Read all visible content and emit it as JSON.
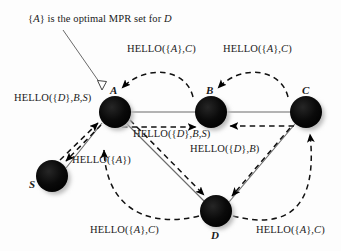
{
  "figure": {
    "type": "network-diagram",
    "caption": "{A} is the optimal MPR set for D",
    "caption_plain": "{A} is the optimal MPR set for D",
    "background_color": "#fdfdfd",
    "node_color": "#000000",
    "edge_color": "#555555",
    "arrow_color": "#000000"
  },
  "nodes": [
    {
      "id": "A",
      "label": "A",
      "cx": 115,
      "cy": 112,
      "r": 16
    },
    {
      "id": "B",
      "label": "B",
      "cx": 211,
      "cy": 112,
      "r": 16
    },
    {
      "id": "C",
      "label": "C",
      "cx": 306,
      "cy": 112,
      "r": 16
    },
    {
      "id": "S",
      "label": "S",
      "cx": 52,
      "cy": 176,
      "r": 16
    },
    {
      "id": "D",
      "label": "D",
      "cx": 216,
      "cy": 211,
      "r": 16
    }
  ],
  "links": [
    {
      "from": "S",
      "to": "A",
      "style": "solid"
    },
    {
      "from": "A",
      "to": "B",
      "style": "solid"
    },
    {
      "from": "B",
      "to": "C",
      "style": "solid"
    },
    {
      "from": "A",
      "to": "D",
      "style": "solid"
    },
    {
      "from": "C",
      "to": "D",
      "style": "solid"
    }
  ],
  "messages": [
    {
      "id": "m-top-left",
      "text": "HELLO({A},C)",
      "sender": "B",
      "receiver": "A",
      "x": 127,
      "y": 44
    },
    {
      "id": "m-top-right",
      "text": "HELLO({A},C)",
      "sender": "C",
      "receiver": "B",
      "x": 223,
      "y": 44
    },
    {
      "id": "m-left",
      "text": "HELLO({D},B,S)",
      "sender": "A",
      "receiver": "S",
      "x": 14,
      "y": 93
    },
    {
      "id": "m-center",
      "text": "HELLO({D},B,S)",
      "sender": "A",
      "receiver": "D",
      "x": 133,
      "y": 129
    },
    {
      "id": "m-right-mid",
      "text": "HELLO({D},B)",
      "sender": "C",
      "receiver": "D",
      "x": 190,
      "y": 144
    },
    {
      "id": "m-near-s",
      "text": "HELLO({A})",
      "sender": "S",
      "receiver": "A",
      "x": 72,
      "y": 155
    },
    {
      "id": "m-bottom-left",
      "text": "HELLO({A},C)",
      "sender": "D",
      "receiver": "A",
      "x": 90,
      "y": 225
    },
    {
      "id": "m-bottom-right",
      "text": "HELLO({A},C)",
      "sender": "D",
      "receiver": "C",
      "x": 256,
      "y": 225
    }
  ],
  "node_label_positions": [
    {
      "id": "A",
      "x": 110,
      "y": 85
    },
    {
      "id": "B",
      "x": 206,
      "y": 85
    },
    {
      "id": "C",
      "x": 302,
      "y": 85
    },
    {
      "id": "S",
      "x": 29,
      "y": 179
    },
    {
      "id": "D",
      "x": 211,
      "y": 230
    }
  ]
}
